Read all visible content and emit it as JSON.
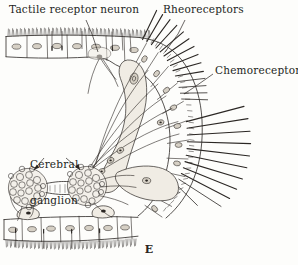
{
  "figure": {
    "caption": "E",
    "background_color": "#fdfdfb",
    "ink_color": "#2b2724",
    "cell_fill_color": "#f2efe9",
    "nucleus_color": "#cfc9bf"
  },
  "labels": {
    "tactile_receptor_neuron": "Tactile receptor neuron",
    "rheoreceptors": "Rheoreceptors",
    "chemoreceptors": "Chemoreceptors",
    "cerebral_ganglion_line1": "Cerebral",
    "cerebral_ganglion_line2": "ganglion"
  },
  "structures": {
    "upper_epithelium": {
      "name": "upper columnar epithelium",
      "cell_count": 7,
      "has_cilia": true,
      "cilia_direction": "up"
    },
    "lower_epithelium": {
      "name": "lower columnar epithelium",
      "cell_count": 8,
      "has_cilia": true,
      "cilia_direction": "down"
    },
    "marginal_epithelium": {
      "name": "curved marginal epithelium bearing sensory bristles",
      "cell_count": 12,
      "has_bristles": true
    },
    "cerebral_ganglia": {
      "count": 2,
      "granule_count_each": 26,
      "connected_by": "commissure"
    },
    "sensory_bristles": {
      "rheoreceptor_bristles": 14,
      "chemoreceptor_bristles": 9
    },
    "receptor_neurons": {
      "count": 8,
      "description": "bipolar neurons with axons converging toward the cerebral ganglia"
    }
  }
}
